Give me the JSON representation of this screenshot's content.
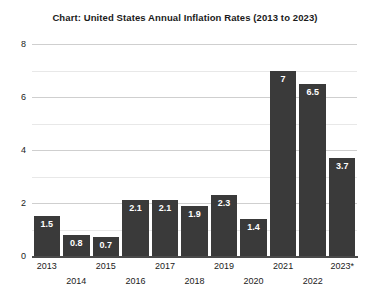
{
  "chart_data": {
    "type": "bar",
    "title": "Chart: United States Annual Inflation Rates (2013 to 2023)",
    "xlabel": "",
    "ylabel": "",
    "categories": [
      "2013",
      "2014",
      "2015",
      "2016",
      "2017",
      "2018",
      "2019",
      "2020",
      "2021",
      "2022",
      "2023*"
    ],
    "values": [
      1.5,
      0.8,
      0.7,
      2.1,
      2.1,
      1.9,
      2.3,
      1.4,
      7,
      6.5,
      3.7
    ],
    "value_labels": [
      "1.5",
      "0.8",
      "0.7",
      "2.1",
      "2.1",
      "1.9",
      "2.3",
      "1.4",
      "7",
      "6.5",
      "3.7"
    ],
    "ylim": [
      0,
      8
    ],
    "y_ticks": [
      0,
      2,
      4,
      6,
      8
    ],
    "y_tick_labels": [
      "0",
      "2",
      "4",
      "6",
      "8"
    ],
    "y_minor_ticks": [
      1,
      3,
      5,
      7
    ],
    "grid": true,
    "legend": "none",
    "bar_color": "#3a3a3a",
    "value_label_color": "#ffffff",
    "gridline_color": "#d8d8d8",
    "axis_color": "#4a4a4a",
    "background_color": "#ffffff"
  }
}
